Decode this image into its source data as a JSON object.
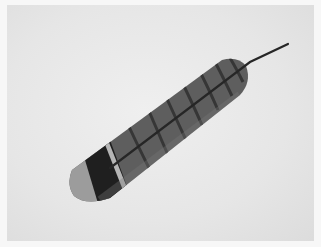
{
  "image": {
    "subject": "barred bird tail feather",
    "style": "black-and-white photograph",
    "colors": {
      "background": "#e8e8e8",
      "feather_body": "#5a5a5a",
      "feather_bars": "#3a3a3a",
      "dark_band": "#1e1e1e",
      "tip": "#9a9a9a",
      "rachis": "#2a2a2a"
    }
  }
}
